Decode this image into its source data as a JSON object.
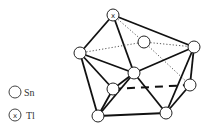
{
  "figure": {
    "background": "#ffffff",
    "line_color": "#111111",
    "atom_fill": "#ffffff",
    "atom_radius": 6
  },
  "legend": {
    "items": [
      {
        "symbol": "open-circle",
        "label": "Sn"
      },
      {
        "symbol": "circle-x",
        "label": "Tl"
      }
    ]
  },
  "atoms": [
    {
      "id": "tl1",
      "element": "Tl",
      "x": 113,
      "y": 15
    },
    {
      "id": "sn_left",
      "element": "Sn",
      "x": 80,
      "y": 53
    },
    {
      "id": "sn_back",
      "element": "Sn",
      "x": 144,
      "y": 42
    },
    {
      "id": "sn_right",
      "element": "Sn",
      "x": 194,
      "y": 47
    },
    {
      "id": "sn_center",
      "element": "Sn",
      "x": 134,
      "y": 73
    },
    {
      "id": "sn_left_inner",
      "element": "Sn",
      "x": 113,
      "y": 89
    },
    {
      "id": "sn_right_inner",
      "element": "Sn",
      "x": 190,
      "y": 85
    },
    {
      "id": "sn_bottom_left",
      "element": "Sn",
      "x": 98,
      "y": 116
    },
    {
      "id": "sn_bottom_right",
      "element": "Sn",
      "x": 166,
      "y": 113
    }
  ],
  "bonds": [
    {
      "a": "tl1",
      "b": "sn_left",
      "style": "bold"
    },
    {
      "a": "tl1",
      "b": "sn_center",
      "style": "bold"
    },
    {
      "a": "tl1",
      "b": "sn_right",
      "style": "bold"
    },
    {
      "a": "tl1",
      "b": "sn_back",
      "style": "dotted"
    },
    {
      "a": "sn_left",
      "b": "sn_back",
      "style": "dotted"
    },
    {
      "a": "sn_back",
      "b": "sn_right",
      "style": "dotted"
    },
    {
      "a": "sn_back",
      "b": "sn_right_inner",
      "style": "dotted"
    },
    {
      "a": "sn_left",
      "b": "sn_center",
      "style": "bold"
    },
    {
      "a": "sn_right",
      "b": "sn_center",
      "style": "bold"
    },
    {
      "a": "sn_left",
      "b": "sn_left_inner",
      "style": "bold"
    },
    {
      "a": "sn_left",
      "b": "sn_bottom_left",
      "style": "bold"
    },
    {
      "a": "sn_center",
      "b": "sn_left_inner",
      "style": "bold"
    },
    {
      "a": "sn_center",
      "b": "sn_bottom_left",
      "style": "bold"
    },
    {
      "a": "sn_center",
      "b": "sn_bottom_right",
      "style": "bold"
    },
    {
      "a": "sn_left_inner",
      "b": "sn_bottom_left",
      "style": "bold"
    },
    {
      "a": "sn_left_inner",
      "b": "sn_right_inner",
      "style": "dashed-bold"
    },
    {
      "a": "sn_right",
      "b": "sn_right_inner",
      "style": "bold"
    },
    {
      "a": "sn_right",
      "b": "sn_bottom_right",
      "style": "bold"
    },
    {
      "a": "sn_right_inner",
      "b": "sn_bottom_right",
      "style": "bold"
    },
    {
      "a": "sn_bottom_left",
      "b": "sn_bottom_right",
      "style": "bold"
    }
  ]
}
